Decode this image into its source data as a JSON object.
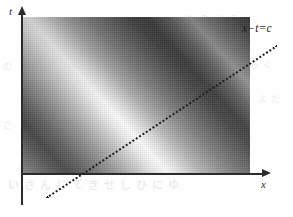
{
  "figure": {
    "title": "",
    "background_color": "#fefefe"
  },
  "axes": {
    "x": {
      "label": "x",
      "name": "x-axis",
      "arrow": "right-arrowhead"
    },
    "t": {
      "label": "t",
      "name": "t-axis",
      "arrow": "up-arrowhead"
    }
  },
  "annotations": [
    {
      "name": "characteristic-line-label",
      "text": "x−t=c",
      "line_style": "dotted"
    }
  ],
  "bleed_through": [
    {
      "text": "いさんじてきせしひにゆ"
    },
    {
      "text": "ちのぶこ"
    },
    {
      "text": "らく"
    },
    {
      "text": "よた"
    },
    {
      "text": "の"
    },
    {
      "text": "さ"
    }
  ],
  "chart_data": {
    "type": "heatmap",
    "title": "",
    "xlabel": "x",
    "ylabel": "t",
    "grid": false,
    "legend": null,
    "colormap": "grayscale",
    "value_range": [
      0,
      1
    ],
    "bands": [
      {
        "kind": "trough",
        "brightness": 0.18,
        "offset_c": -40
      },
      {
        "kind": "crest",
        "brightness": 0.98,
        "offset_c": 10
      },
      {
        "kind": "trough",
        "brightness": 0.22,
        "offset_c": 62
      },
      {
        "kind": "crest",
        "brightness": 0.96,
        "offset_c": 112
      },
      {
        "kind": "trough",
        "brightness": 0.2,
        "offset_c": 166
      }
    ],
    "band_angle_deg": 45,
    "annotation_lines": [
      {
        "label": "x−t=c",
        "type": "dotted",
        "slope": 0.66
      }
    ],
    "axis_ranges": {
      "xlim": [
        0,
        1
      ],
      "tlim": [
        0,
        1
      ]
    }
  }
}
